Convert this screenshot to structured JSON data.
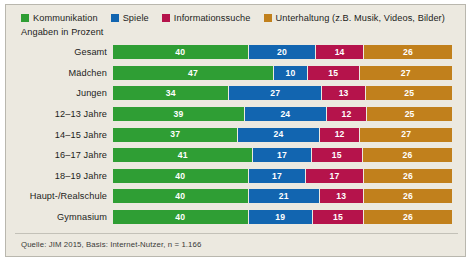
{
  "legend": {
    "items": [
      {
        "label": "Kommunikation",
        "color": "#2f9e34",
        "icon": "square-swatch-icon"
      },
      {
        "label": "Spiele",
        "color": "#1265b0",
        "icon": "square-swatch-icon"
      },
      {
        "label": "Informationssuche",
        "color": "#b5134b",
        "icon": "square-swatch-icon"
      },
      {
        "label": "Unterhaltung (z.B. Musik, Videos, Bilder)",
        "color": "#c1801c",
        "icon": "square-swatch-icon"
      }
    ],
    "subtitle": "Angaben in Prozent"
  },
  "source_note": "Quelle: JIM 2015, Basis: Internet-Nutzer, n = 1.166",
  "chart_data": {
    "type": "bar",
    "orientation": "horizontal",
    "stacked": true,
    "title": "",
    "subtitle": "Angaben in Prozent",
    "xlabel": "",
    "ylabel": "",
    "xlim": [
      0,
      100
    ],
    "grid": false,
    "legend_position": "top",
    "value_unit": "%",
    "categories": [
      "Gesamt",
      "Mädchen",
      "Jungen",
      "12–13 Jahre",
      "14–15 Jahre",
      "16–17 Jahre",
      "18–19 Jahre",
      "Haupt-/Realschule",
      "Gymnasium"
    ],
    "series": [
      {
        "name": "Kommunikation",
        "color": "#2f9e34",
        "values": [
          40,
          47,
          34,
          39,
          37,
          41,
          40,
          40,
          40
        ]
      },
      {
        "name": "Spiele",
        "color": "#1265b0",
        "values": [
          20,
          10,
          27,
          24,
          24,
          17,
          17,
          21,
          19
        ]
      },
      {
        "name": "Informationssuche",
        "color": "#b5134b",
        "values": [
          14,
          15,
          13,
          12,
          12,
          15,
          17,
          13,
          15
        ]
      },
      {
        "name": "Unterhaltung (z.B. Musik, Videos, Bilder)",
        "color": "#c1801c",
        "values": [
          26,
          27,
          25,
          25,
          27,
          26,
          26,
          26,
          26
        ]
      }
    ]
  }
}
